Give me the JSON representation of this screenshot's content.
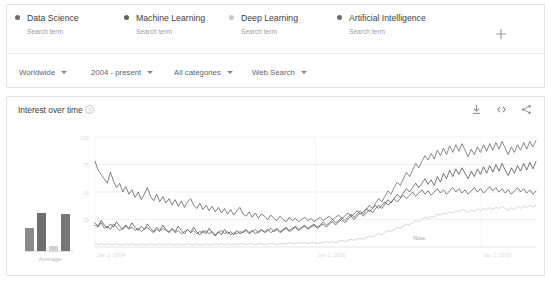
{
  "terms": {
    "subtitle_label": "Search term",
    "items": [
      {
        "name": "Data Science",
        "subtitle": "Search term",
        "color": "#6b6b6b",
        "left": 8,
        "line_color": "#737373"
      },
      {
        "name": "Machine Learning",
        "subtitle": "Search term",
        "color": "#5f5f5f",
        "left": 117,
        "line_color": "#5e5e5e"
      },
      {
        "name": "Deep Learning",
        "subtitle": "Search term",
        "color": "#c9c9c9",
        "left": 222,
        "line_color": "#cfcfcf"
      },
      {
        "name": "Artificial Intelligence",
        "subtitle": "Search term",
        "color": "#6e6e6e",
        "left": 330,
        "line_color": "#6a6a6a"
      }
    ],
    "add_icon": "plus-icon"
  },
  "filters": [
    {
      "label": "Worldwide",
      "left": 12,
      "icon": "chevron-down-icon"
    },
    {
      "label": "2004 - present",
      "left": 84,
      "icon": "chevron-down-icon"
    },
    {
      "label": "All categories",
      "left": 167,
      "icon": "chevron-down-icon"
    },
    {
      "label": "Web Search",
      "left": 245,
      "icon": "chevron-down-icon"
    }
  ],
  "chart_panel": {
    "title": "Interest over time",
    "help_icon": "help-circle-icon",
    "help_glyph": "?",
    "actions": [
      {
        "name": "download-icon"
      },
      {
        "name": "embed-code-icon"
      },
      {
        "name": "share-icon"
      }
    ]
  },
  "average_panel": {
    "label": "Average",
    "values": [
      38,
      62,
      8,
      60
    ],
    "colors": [
      "#8a8a8a",
      "#6e6e6e",
      "#d2d2d2",
      "#767676"
    ]
  },
  "chart_data": {
    "type": "line",
    "title": "Interest over time",
    "xlabel": "",
    "ylabel": "",
    "ylim": [
      0,
      100
    ],
    "grid": true,
    "legend_position": "top",
    "xticks": [
      "Jan 1, 2004",
      "Jan 1, 2010",
      "Jan 1, 2016"
    ],
    "xtick_positions": [
      0,
      0.5,
      0.875
    ],
    "yticks": [
      25,
      50,
      75,
      100
    ],
    "annotations": [
      {
        "text": "Note",
        "x": 0.735,
        "y": 6
      }
    ],
    "series": [
      {
        "name": "Data Science",
        "color": "#737373",
        "values": [
          20,
          18,
          22,
          17,
          19,
          16,
          21,
          18,
          15,
          17,
          19,
          16,
          18,
          15,
          17,
          14,
          16,
          18,
          15,
          13,
          16,
          14,
          17,
          15,
          14,
          16,
          13,
          15,
          12,
          14,
          16,
          13,
          15,
          12,
          14,
          13,
          15,
          12,
          14,
          11,
          13,
          15,
          12,
          14,
          11,
          13,
          12,
          14,
          13,
          15,
          12,
          14,
          16,
          13,
          15,
          14,
          16,
          13,
          15,
          17,
          14,
          16,
          18,
          15,
          17,
          19,
          16,
          18,
          20,
          17,
          19,
          21,
          18,
          20,
          23,
          20,
          22,
          25,
          22,
          24,
          27,
          24,
          27,
          30,
          27,
          30,
          33,
          30,
          34,
          38,
          35,
          40,
          44,
          41,
          46,
          51,
          48,
          54,
          59,
          56,
          62,
          68,
          64,
          70,
          76,
          72,
          78,
          83,
          79,
          85,
          80,
          88,
          83,
          90,
          84,
          92,
          86,
          93,
          87,
          94,
          88,
          82,
          89,
          84,
          91,
          86,
          93,
          87,
          94,
          88,
          95,
          89,
          96,
          90,
          84,
          91,
          86,
          93,
          88,
          95,
          89,
          96,
          91,
          97
        ]
      },
      {
        "name": "Machine Learning",
        "color": "#5e5e5e",
        "values": [
          22,
          19,
          24,
          20,
          17,
          21,
          18,
          23,
          19,
          16,
          20,
          17,
          22,
          18,
          15,
          19,
          16,
          21,
          17,
          14,
          18,
          15,
          20,
          16,
          13,
          17,
          14,
          19,
          15,
          12,
          16,
          13,
          18,
          14,
          11,
          15,
          12,
          17,
          13,
          10,
          14,
          11,
          16,
          12,
          14,
          11,
          15,
          12,
          14,
          16,
          13,
          15,
          12,
          14,
          16,
          13,
          15,
          17,
          14,
          16,
          13,
          15,
          17,
          14,
          16,
          18,
          15,
          17,
          19,
          16,
          18,
          20,
          17,
          19,
          21,
          18,
          21,
          23,
          20,
          23,
          25,
          22,
          25,
          28,
          25,
          28,
          31,
          28,
          31,
          34,
          31,
          35,
          38,
          35,
          39,
          43,
          40,
          44,
          48,
          45,
          49,
          53,
          50,
          54,
          58,
          54,
          58,
          62,
          57,
          61,
          56,
          64,
          59,
          67,
          62,
          70,
          64,
          71,
          66,
          72,
          67,
          62,
          69,
          64,
          71,
          66,
          73,
          67,
          74,
          68,
          75,
          69,
          76,
          70,
          65,
          72,
          67,
          74,
          69,
          76,
          70,
          77,
          71,
          78
        ]
      },
      {
        "name": "Deep Learning",
        "color": "#cfcfcf",
        "values": [
          3,
          2,
          3,
          2,
          3,
          2,
          2,
          3,
          2,
          2,
          3,
          2,
          3,
          2,
          2,
          3,
          2,
          2,
          3,
          2,
          2,
          3,
          2,
          2,
          3,
          2,
          2,
          3,
          2,
          2,
          3,
          2,
          2,
          3,
          2,
          2,
          3,
          2,
          2,
          3,
          2,
          3,
          2,
          3,
          2,
          3,
          2,
          3,
          3,
          2,
          3,
          3,
          2,
          3,
          3,
          2,
          3,
          3,
          3,
          2,
          3,
          3,
          3,
          4,
          3,
          3,
          4,
          3,
          4,
          3,
          4,
          4,
          3,
          4,
          4,
          5,
          4,
          5,
          4,
          5,
          6,
          5,
          6,
          7,
          6,
          7,
          8,
          7,
          9,
          10,
          9,
          11,
          12,
          11,
          13,
          15,
          14,
          16,
          18,
          17,
          19,
          21,
          20,
          22,
          24,
          23,
          25,
          27,
          26,
          28,
          27,
          30,
          29,
          31,
          30,
          32,
          31,
          33,
          32,
          34,
          33,
          31,
          34,
          32,
          35,
          33,
          35,
          34,
          36,
          34,
          36,
          35,
          37,
          35,
          33,
          36,
          34,
          37,
          35,
          37,
          36,
          38,
          36,
          38
        ]
      },
      {
        "name": "Artificial Intelligence",
        "color": "#6a6a6a",
        "values": [
          78,
          70,
          66,
          62,
          58,
          68,
          60,
          54,
          58,
          50,
          55,
          48,
          52,
          45,
          50,
          43,
          48,
          54,
          46,
          42,
          48,
          41,
          46,
          40,
          44,
          38,
          43,
          37,
          42,
          36,
          41,
          44,
          38,
          35,
          40,
          34,
          38,
          33,
          37,
          32,
          36,
          31,
          35,
          30,
          34,
          29,
          33,
          36,
          30,
          28,
          32,
          27,
          31,
          26,
          30,
          28,
          25,
          29,
          26,
          24,
          28,
          25,
          23,
          27,
          24,
          26,
          23,
          25,
          27,
          24,
          26,
          23,
          25,
          27,
          24,
          26,
          28,
          25,
          27,
          29,
          26,
          28,
          31,
          28,
          30,
          33,
          30,
          32,
          35,
          32,
          35,
          38,
          35,
          38,
          41,
          38,
          41,
          44,
          41,
          44,
          47,
          44,
          47,
          50,
          46,
          49,
          52,
          48,
          51,
          47,
          50,
          53,
          49,
          52,
          48,
          51,
          54,
          50,
          53,
          49,
          52,
          48,
          51,
          54,
          50,
          53,
          49,
          52,
          55,
          51,
          54,
          50,
          53,
          49,
          52,
          48,
          51,
          54,
          50,
          53,
          49,
          52,
          48,
          51
        ]
      }
    ]
  }
}
